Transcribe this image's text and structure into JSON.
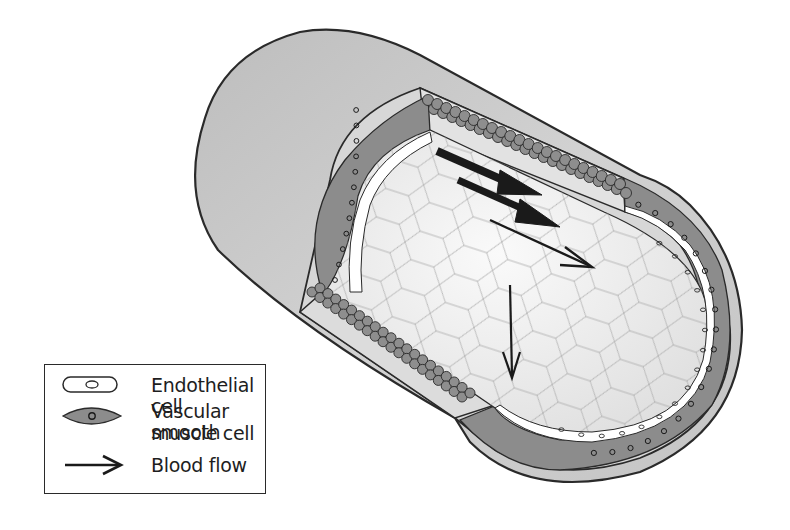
{
  "diagram": {
    "layers": [
      {
        "name": "outer adventitia",
        "color": "#c9c9c9"
      },
      {
        "name": "vascular smooth muscle cell layer",
        "color": "#8a8a8a"
      },
      {
        "name": "endothelial cell layer",
        "color": "#ffffff"
      },
      {
        "name": "lumen surface (endothelial mosaic)",
        "color": "#ececec"
      }
    ],
    "flow_arrows": [
      {
        "name": "flow-arrow-thick-1",
        "style": "thick"
      },
      {
        "name": "flow-arrow-thick-2",
        "style": "thick"
      },
      {
        "name": "flow-arrow-thin",
        "style": "thin"
      },
      {
        "name": "flow-arrow-down",
        "style": "thin"
      }
    ]
  },
  "legend": {
    "items": [
      {
        "icon": "endothelial-cell-icon",
        "label": "Endothelial cell"
      },
      {
        "icon": "smooth-muscle-cell-icon",
        "label_line1": "Vascular smooth",
        "label_line2": "muscle cell"
      },
      {
        "icon": "arrow-right-icon",
        "label": "Blood flow"
      }
    ]
  },
  "colors": {
    "outline": "#2a2a2a",
    "outer_wall": "#c9c9c9",
    "muscle": "#8a8a8a",
    "lumen": "#ededed",
    "mosaic_line": "#a8a8a8"
  }
}
